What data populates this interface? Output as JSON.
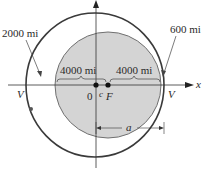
{
  "figure": {
    "type": "orbit-ellipse-diagram",
    "labels": {
      "apogee_altitude": "2000 mi",
      "perigee_altitude": "600 mi",
      "earth_radius_left": "4000 mi",
      "earth_radius_right": "4000 mi",
      "origin": "0",
      "center_offset": "c",
      "focus": "F",
      "vertex_left": "V",
      "vertex_right": "V",
      "semi_major_axis": "a",
      "x_axis": "x"
    },
    "colors": {
      "earth_fill": "#d4d4d4",
      "earth_stroke": "#707070",
      "orbit_stroke": "#3a3a3a",
      "axis_stroke": "#333333",
      "text": "#2a2a2a"
    }
  }
}
